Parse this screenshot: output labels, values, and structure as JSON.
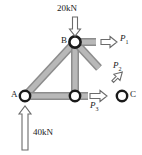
{
  "figure": {
    "type": "truss-free-body-diagram",
    "background_color": "#ffffff",
    "member_fill_color": "#b3b3b3",
    "member_stroke_color": "#8c8c8c",
    "node_stroke_color": "#1a1a1a",
    "node_fill_color": "#ffffff",
    "arrow_stroke_color": "#4d4d4d",
    "arrow_fill_color": "#ffffff",
    "text_color": "#1a1a1a"
  },
  "nodes": [
    {
      "id": "A",
      "label": "A",
      "x": 25,
      "y": 96,
      "label_x": 11,
      "label_y": 92
    },
    {
      "id": "B",
      "label": "B",
      "x": 75,
      "y": 42,
      "label_x": 61,
      "label_y": 38
    },
    {
      "id": "D",
      "label": "",
      "x": 75,
      "y": 96,
      "label_x": 0,
      "label_y": 0
    },
    {
      "id": "C",
      "label": "C",
      "x": 122,
      "y": 96,
      "label_x": 131,
      "label_y": 92
    }
  ],
  "members": [
    {
      "from": "A",
      "to": "B"
    },
    {
      "from": "B",
      "to": "D"
    },
    {
      "from": "A",
      "to": "D"
    },
    {
      "from": "D",
      "to": "C"
    },
    {
      "from": "B",
      "to": "C"
    },
    {
      "from": "B",
      "to": "right-stub"
    }
  ],
  "loads": [
    {
      "name": "applied-load-20kN",
      "label": "20kN",
      "magnitude": 20,
      "unit": "kN",
      "direction": "down",
      "applied_at": "B",
      "label_x": 57,
      "label_y": 5
    },
    {
      "name": "support-reaction-40kN",
      "label": "40kN",
      "magnitude": 40,
      "unit": "kN",
      "direction": "up",
      "applied_at": "A",
      "label_x": 33,
      "label_y": 131
    }
  ],
  "forces": [
    {
      "name": "force-P1",
      "symbol": "P",
      "subscript": "1",
      "direction": "right",
      "applied_at": "B",
      "label_x": 120,
      "label_y": 36
    },
    {
      "name": "force-P2",
      "symbol": "P",
      "subscript": "2",
      "direction": "down-right",
      "applied_at": "B-C member",
      "label_x": 113,
      "label_y": 64
    },
    {
      "name": "force-P3",
      "symbol": "P",
      "subscript": "3",
      "direction": "right",
      "applied_at": "D",
      "label_x": 90,
      "label_y": 104
    }
  ]
}
